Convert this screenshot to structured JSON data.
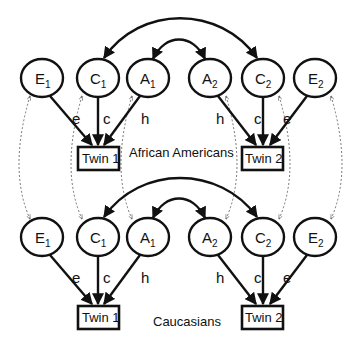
{
  "diagram": {
    "type": "ACE twin model path diagram",
    "colors": {
      "stroke": "#111111",
      "dotted": "#555555",
      "background": "#ffffff"
    },
    "groups": [
      {
        "label": "African Americans",
        "latents": [
          {
            "id": "E1",
            "letter": "E",
            "sub": "1"
          },
          {
            "id": "C1",
            "letter": "C",
            "sub": "1"
          },
          {
            "id": "A1",
            "letter": "A",
            "sub": "1"
          },
          {
            "id": "A2",
            "letter": "A",
            "sub": "2"
          },
          {
            "id": "C2",
            "letter": "C",
            "sub": "2"
          },
          {
            "id": "E2",
            "letter": "E",
            "sub": "2"
          }
        ],
        "twins": [
          "Twin 1",
          "Twin 2"
        ],
        "paths_twin1": [
          "e",
          "c",
          "h"
        ],
        "paths_twin2": [
          "h",
          "c",
          "e"
        ]
      },
      {
        "label": "Caucasians",
        "latents": [
          {
            "id": "E1",
            "letter": "E",
            "sub": "1"
          },
          {
            "id": "C1",
            "letter": "C",
            "sub": "1"
          },
          {
            "id": "A1",
            "letter": "A",
            "sub": "1"
          },
          {
            "id": "A2",
            "letter": "A",
            "sub": "2"
          },
          {
            "id": "C2",
            "letter": "C",
            "sub": "2"
          },
          {
            "id": "E2",
            "letter": "E",
            "sub": "2"
          }
        ],
        "twins": [
          "Twin 1",
          "Twin 2"
        ],
        "paths_twin1": [
          "e",
          "c",
          "h"
        ],
        "paths_twin2": [
          "h",
          "c",
          "e"
        ]
      }
    ],
    "correlations": [
      "C1 <-> C2",
      "A1 <-> A2"
    ],
    "cross_group_links": [
      "E1",
      "C1",
      "A1",
      "A2",
      "C2",
      "E2"
    ]
  }
}
